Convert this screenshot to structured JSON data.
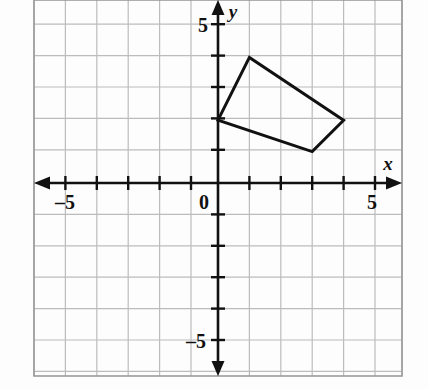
{
  "figure": {
    "type": "coordinate-plane",
    "background_color": "#fdfdfd",
    "grid_color": "#bcbcbc",
    "grid_border_color": "#9a9a9a",
    "axis_color": "#111111",
    "shape_color": "#111111"
  },
  "axes": {
    "x_axis_label": "x",
    "y_axis_label": "y",
    "origin_label": "0",
    "x_tick_label_negative": "–5",
    "x_tick_label_positive": "5",
    "y_tick_label_positive": "5",
    "y_tick_label_negative": "–5",
    "x_min": -5.85,
    "x_max": 5.85,
    "y_min": -6.15,
    "y_max": 5.8,
    "tick_interval": 1,
    "labeled_ticks_x": [
      -5,
      0,
      5
    ],
    "labeled_ticks_y": [
      5,
      -5
    ],
    "arrowheads": [
      "left",
      "right",
      "up",
      "down"
    ]
  },
  "chart_data": {
    "type": "scatter",
    "title": "",
    "xlabel": "x",
    "ylabel": "y",
    "xlim": [
      -5.85,
      5.85
    ],
    "ylim": [
      -6.15,
      5.8
    ],
    "grid": true,
    "legend": null,
    "xticks": [
      -5,
      -4,
      -3,
      -2,
      -1,
      0,
      1,
      2,
      3,
      4,
      5
    ],
    "yticks": [
      -5,
      -4,
      -3,
      -2,
      -1,
      0,
      1,
      2,
      3,
      4,
      5
    ],
    "xticklabels": [
      "–5",
      "",
      "",
      "",
      "",
      "0",
      "",
      "",
      "",
      "",
      "5"
    ],
    "yticklabels": [
      "–5",
      "",
      "",
      "",
      "",
      "",
      "",
      "",
      "",
      "",
      "5"
    ],
    "series": [
      {
        "name": "quadrilateral",
        "kind": "polygon",
        "closed": true,
        "filled": false,
        "stroke_color": "#111111",
        "stroke_width": 3,
        "x": [
          0,
          1,
          4,
          3
        ],
        "y": [
          2,
          4,
          2,
          1
        ],
        "vertices": [
          {
            "label": "",
            "x": 0,
            "y": 2
          },
          {
            "label": "",
            "x": 1,
            "y": 4
          },
          {
            "label": "",
            "x": 4,
            "y": 2
          },
          {
            "label": "",
            "x": 3,
            "y": 1
          }
        ]
      }
    ]
  },
  "geometry_px": {
    "origin_x": 218,
    "origin_y": 183,
    "unit_px": 31.4,
    "grid_left": 34,
    "grid_right": 402,
    "grid_top": 0,
    "grid_bottom": 376
  },
  "label_positions": {
    "x_label": {
      "x": 388,
      "y": 168
    },
    "y_label": {
      "x": 230,
      "y": 16
    },
    "origin": {
      "x": 203,
      "y": 203
    },
    "x_neg5": {
      "x": 58,
      "y": 205
    },
    "x_pos5": {
      "x": 371,
      "y": 205
    },
    "y_pos5": {
      "x": 202,
      "y": 32
    },
    "y_neg5": {
      "x": 196,
      "y": 352
    }
  }
}
